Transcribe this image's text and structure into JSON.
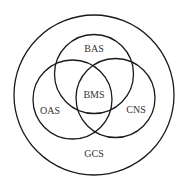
{
  "diagram": {
    "type": "venn",
    "colors": {
      "stroke": "#1a1a1a",
      "text": "#333333",
      "background": "#ffffff"
    },
    "outer": {
      "label": "GCS",
      "cx": 94,
      "cy": 95,
      "r": 80,
      "label_x": 94,
      "label_y": 155
    },
    "circles": [
      {
        "label": "BAS",
        "cx": 94,
        "cy": 74,
        "r": 39.5,
        "label_x": 94,
        "label_y": 50
      },
      {
        "label": "OAS",
        "cx": 72.5,
        "cy": 99.5,
        "r": 39.5,
        "label_x": 50,
        "label_y": 112
      },
      {
        "label": "CNS",
        "cx": 115.5,
        "cy": 98,
        "r": 39.5,
        "label_x": 136,
        "label_y": 111
      }
    ],
    "center": {
      "label": "BMS",
      "label_x": 94,
      "label_y": 96
    }
  }
}
